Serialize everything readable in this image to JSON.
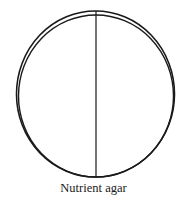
{
  "diagram": {
    "caption": "Nutrient agar",
    "stroke_color": "#1a1a1a",
    "outer_rim": {
      "cx": 95.5,
      "cy": 94,
      "rx": 79,
      "ry": 83
    },
    "inner_rim": {
      "cx": 96,
      "cy": 96,
      "rx": 77,
      "ry": 81
    },
    "divider": {
      "x": 96,
      "y1": 11,
      "y2": 177
    }
  }
}
